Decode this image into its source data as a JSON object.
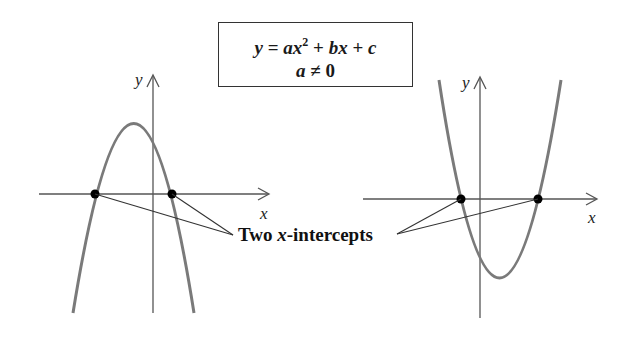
{
  "equation_box": {
    "line1": {
      "y": "y",
      "eq": " = ",
      "a": "a",
      "x": "x",
      "exp": "2",
      "plus1": " + ",
      "b": "b",
      "x2": "x",
      "plus2": " + ",
      "c": "c"
    },
    "line2": {
      "a": "a",
      "neq": " ≠ ",
      "zero": "0"
    }
  },
  "annotation": {
    "prefix": "Two ",
    "var": "x",
    "suffix": "-intercepts"
  },
  "left_graph": {
    "x_axis_label": "x",
    "y_axis_label": "y",
    "opens": "down",
    "curve_color": "#7a7a7a",
    "intercepts": [
      {
        "px": 95,
        "py": 194
      },
      {
        "px": 172,
        "py": 194
      }
    ],
    "vertex": {
      "px": 134,
      "py": 114
    }
  },
  "right_graph": {
    "x_axis_label": "x",
    "y_axis_label": "y",
    "opens": "up",
    "curve_color": "#7a7a7a",
    "intercepts": [
      {
        "px": 461,
        "py": 199
      },
      {
        "px": 538,
        "py": 199
      }
    ],
    "vertex": {
      "px": 499,
      "py": 278
    }
  },
  "colors": {
    "axis": "#555555",
    "curve": "#7a7a7a",
    "point": "#000000",
    "leader": "#333333"
  }
}
